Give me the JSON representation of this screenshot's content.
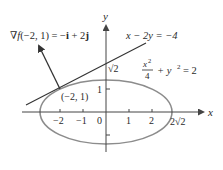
{
  "diagram": {
    "axes": {
      "x_label": "x",
      "y_label": "y",
      "x_ticks": [
        "−2",
        "−1",
        "0",
        "1",
        "2"
      ],
      "y_ticks": [
        "1"
      ],
      "origin_label": "0",
      "x_intercept_label": "2√2",
      "y_intercept_label": "√2"
    },
    "ellipse": {
      "equation_num": "x",
      "equation_num_sup": "2",
      "equation_den": "4",
      "equation_rest_y": "+ y",
      "equation_rest_sup": "2",
      "equation_rest_eq": "= 2",
      "color": "#8c8c8c"
    },
    "tangent_line": {
      "equation": "x − 2y = −4",
      "color": "#333333"
    },
    "gradient": {
      "label_nabla": "∇",
      "label_f": "f",
      "label_args": "(−2, 1) = −",
      "label_i": "i",
      "label_plus": " + 2",
      "label_j": "j",
      "color": "#333333"
    },
    "point": {
      "label": "(−2, 1)"
    }
  }
}
